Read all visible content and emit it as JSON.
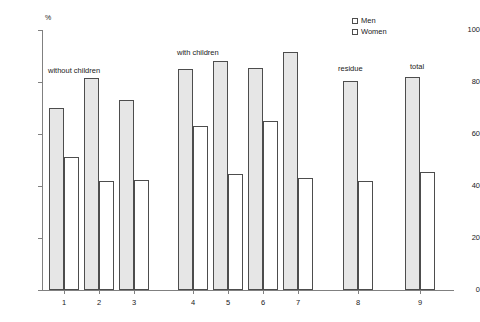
{
  "chart_data": {
    "type": "bar",
    "title": "",
    "subtitle": "",
    "xlabel": "",
    "ylabel": "%",
    "ylim": [
      0,
      100
    ],
    "yticks": [
      0,
      20,
      40,
      60,
      80,
      100
    ],
    "grid": false,
    "legend_position": "top-right",
    "categories": [
      "1",
      "2",
      "3",
      "4",
      "5",
      "6",
      "7",
      "8",
      "9"
    ],
    "series": [
      {
        "name": "Men",
        "values": [
          70,
          81.5,
          73,
          85,
          88,
          85.5,
          91.5,
          80.5,
          82
        ]
      },
      {
        "name": "Women",
        "values": [
          51,
          42,
          42.5,
          63,
          44.5,
          65,
          43,
          42,
          45.5
        ]
      }
    ],
    "annotations": [
      {
        "text": "without children",
        "near_category": "1"
      },
      {
        "text": "with children",
        "near_category": "4"
      },
      {
        "text": "residue",
        "near_category": "8"
      },
      {
        "text": "total",
        "near_category": "9"
      }
    ]
  },
  "legend": {
    "items": [
      {
        "label": "Men"
      },
      {
        "label": "Women"
      }
    ]
  },
  "axis": {
    "y_unit": "%",
    "y_ticks": [
      "100",
      "80",
      "60",
      "40",
      "20",
      "0"
    ],
    "x_ticks": [
      "1",
      "2",
      "3",
      "4",
      "5",
      "6",
      "7",
      "8",
      "9"
    ]
  },
  "colors": {
    "men_fill": "#e6e6e6",
    "women_fill": "#ffffff",
    "bar_stroke": "#4d4d4d",
    "axis": "#808080",
    "text": "#1a1a1a",
    "background": "#ffffff"
  }
}
